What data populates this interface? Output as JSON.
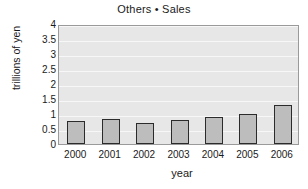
{
  "chart_data": {
    "type": "bar",
    "title": "Others • Sales",
    "xlabel": "year",
    "ylabel": "trillions of yen",
    "categories": [
      "2000",
      "2001",
      "2002",
      "2003",
      "2004",
      "2005",
      "2006"
    ],
    "values": [
      0.8,
      0.87,
      0.73,
      0.83,
      0.95,
      1.05,
      1.33
    ],
    "series": [
      {
        "name": "Others • Sales",
        "values": [
          0.8,
          0.87,
          0.73,
          0.83,
          0.95,
          1.05,
          1.33
        ]
      }
    ],
    "ylim": [
      0,
      4
    ],
    "ytick_labels": [
      "4",
      "3.5",
      "3",
      "2.5",
      "2",
      "1.5",
      "1",
      "0.5",
      "0"
    ],
    "ytick_values": [
      4,
      3.5,
      3,
      2.5,
      2,
      1.5,
      1,
      0.5,
      0
    ],
    "grid": true,
    "legend": false,
    "colors": {
      "bar_fill": "#bdbdbd",
      "bar_border": "#2b2b2b",
      "plot_background": "#e7e7e7",
      "gridline": "#f7f7f7",
      "axis": "#8c8c8c",
      "text": "#1a1a1a",
      "page_background": "#ffffff"
    }
  }
}
